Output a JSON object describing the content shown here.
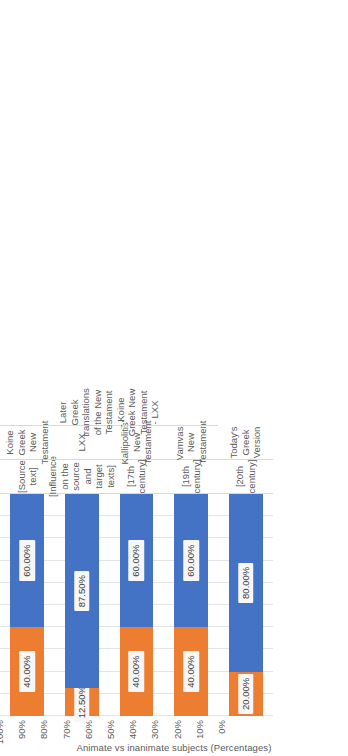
{
  "chart_data": {
    "type": "bar",
    "subtype": "100% stacked bar",
    "orientation": "horizontal-rotated",
    "title": "",
    "xlabel": "",
    "ylabel": "Animate vs inanimate subjects (Percentages)",
    "ylim": [
      0,
      100
    ],
    "grid": true,
    "legend": "none",
    "tick_labels": [
      "100%",
      "90%",
      "80%",
      "70%",
      "60%",
      "50%",
      "40%",
      "30%",
      "20%",
      "10%",
      "0%"
    ],
    "tick_values": [
      100,
      90,
      80,
      70,
      60,
      50,
      40,
      30,
      20,
      10,
      0
    ],
    "categories": [
      "Koine Greek New Testament",
      "LXX",
      "Kallipolitis' New Testament",
      "Vamvas' New Testament",
      "Today's Greek Version"
    ],
    "category_tier1": [
      "[Source text]",
      "[Influence on the source and target texts]",
      "[17th century]",
      "[19th century]",
      "[20th century]"
    ],
    "category_tier3": [
      "",
      "Later Greek translations of the New Testament - Koine Greek New Testament - LXX",
      "",
      "",
      ""
    ],
    "series": [
      {
        "name": "Inanimate",
        "color": "#ED7D31",
        "values": [
          40.0,
          12.5,
          40.0,
          40.0,
          20.0
        ],
        "labels": [
          "40.00%",
          "12.50%",
          "40.00%",
          "40.00%",
          "20.00%"
        ]
      },
      {
        "name": "Animate",
        "color": "#4472C4",
        "values": [
          60.0,
          87.5,
          60.0,
          60.0,
          80.0
        ],
        "labels": [
          "60.00%",
          "87.50%",
          "60.00%",
          "60.00%",
          "80.00%"
        ]
      }
    ]
  },
  "colors": {
    "orange": "#ED7D31",
    "blue": "#4472C4",
    "gridline": "#e4e4e4",
    "text": "#5a5a5a",
    "background": "#ffffff"
  }
}
